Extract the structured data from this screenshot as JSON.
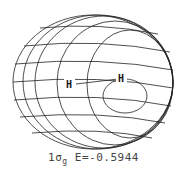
{
  "figure": {
    "type": "molecular-orbital-surface",
    "orbital": {
      "main": "1",
      "symbol": "σ",
      "subscript": "g"
    },
    "energy_label": "E=-0.5944",
    "atoms": [
      {
        "label": "H",
        "x": 70,
        "y": 86
      },
      {
        "label": "H",
        "x": 122,
        "y": 80
      }
    ],
    "colors": {
      "line": "#222222",
      "background": "#ffffff",
      "caption": "#444444"
    }
  }
}
